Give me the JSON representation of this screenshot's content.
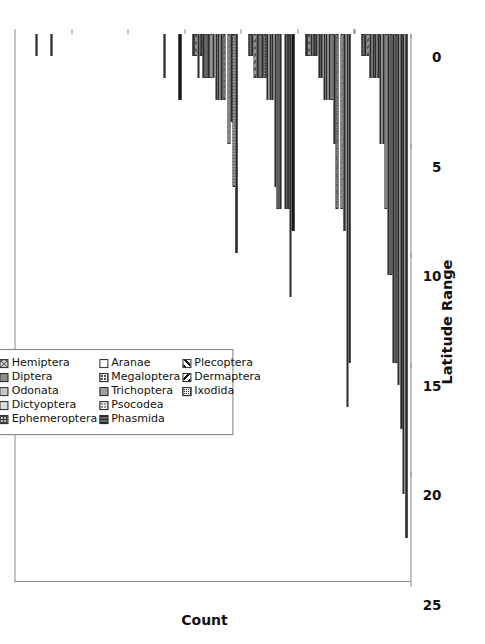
{
  "chart_data": {
    "type": "bar",
    "orientation": "horizontal-rotated",
    "title": "",
    "xlabel": "Latitude Range",
    "ylabel": "Count",
    "ylim": [
      0,
      25
    ],
    "yticks": [
      0,
      5,
      10,
      15,
      20,
      25
    ],
    "grid": false,
    "legend_position": "inside-upper-left",
    "categories": [
      "±0–9",
      "±10–19",
      "±20–29",
      "±30–39",
      "±40–49",
      "±50–59",
      "±60+"
    ],
    "series": [
      {
        "name": "Coleoptera",
        "pattern": "p-solid-black",
        "values": [
          23,
          15,
          9,
          10,
          3,
          0,
          0
        ]
      },
      {
        "name": "Ortoptera",
        "pattern": "p-vlines-light",
        "values": [
          21,
          17,
          12,
          7,
          0,
          0,
          0
        ]
      },
      {
        "name": "Hymenoptera",
        "pattern": "p-solid-dkgray",
        "values": [
          18,
          9,
          8,
          4,
          0,
          0,
          0
        ]
      },
      {
        "name": "Lepidoptera",
        "pattern": "p-diag-light",
        "values": [
          16,
          8,
          8,
          5,
          0,
          0,
          0
        ]
      },
      {
        "name": "Isoptera",
        "pattern": "p-solid-mgray",
        "values": [
          15,
          0,
          0,
          0,
          0,
          0,
          0
        ]
      },
      {
        "name": "Hemiptera",
        "pattern": "p-cross-gray",
        "values": [
          15,
          8,
          8,
          3,
          0,
          0,
          0
        ]
      },
      {
        "name": "Diptera",
        "pattern": "p-solid-gray",
        "values": [
          11,
          5,
          8,
          3,
          2,
          0,
          1
        ]
      },
      {
        "name": "Odonata",
        "pattern": "p-solid-ltgray",
        "values": [
          11,
          3,
          7,
          3,
          0,
          0,
          0
        ]
      },
      {
        "name": "Dictyoptera",
        "pattern": "p-solid-xlt",
        "values": [
          8,
          3,
          3,
          3,
          0,
          0,
          0
        ]
      },
      {
        "name": "Ephemeroptera",
        "pattern": "p-checker",
        "values": [
          5,
          3,
          3,
          2,
          0,
          0,
          0
        ]
      },
      {
        "name": "Aranae",
        "pattern": "p-white",
        "values": [
          5,
          3,
          3,
          2,
          0,
          0,
          0
        ]
      },
      {
        "name": "Megaloptera",
        "pattern": "p-dots-dark",
        "values": [
          2,
          2,
          2,
          2,
          0,
          0,
          0
        ]
      },
      {
        "name": "Trichoptera",
        "pattern": "p-solid-med",
        "values": [
          2,
          2,
          2,
          2,
          0,
          0,
          1
        ]
      },
      {
        "name": "Psocodea",
        "pattern": "p-dots-gray",
        "values": [
          2,
          1,
          2,
          2,
          0,
          0,
          0
        ]
      },
      {
        "name": "Phasmida",
        "pattern": "p-hlines-dk",
        "values": [
          2,
          1,
          2,
          1,
          0,
          0,
          0
        ]
      },
      {
        "name": "Plecoptera",
        "pattern": "p-diag-dark",
        "values": [
          1,
          1,
          2,
          2,
          0,
          0,
          0
        ]
      },
      {
        "name": "Dermaptera",
        "pattern": "p-diag-rev",
        "values": [
          1,
          1,
          1,
          1,
          0,
          0,
          0
        ]
      },
      {
        "name": "Ixodida",
        "pattern": "p-dense-check",
        "values": [
          1,
          1,
          1,
          1,
          0,
          0,
          0
        ]
      },
      {
        "name": "—",
        "pattern": "p-blank",
        "values": [
          0,
          0,
          0,
          0,
          0,
          0,
          0
        ]
      },
      {
        "name": "—",
        "pattern": "p-blank2",
        "values": [
          0,
          0,
          0,
          0,
          0,
          0,
          0
        ]
      }
    ],
    "legend_entries": [
      {
        "label": "Coleoptera",
        "pattern": "p-solid-black"
      },
      {
        "label": "Ortoptera",
        "pattern": "p-vlines-light"
      },
      {
        "label": "Hymenoptera",
        "pattern": "p-solid-dkgray"
      },
      {
        "label": "Lepidoptera",
        "pattern": "p-diag-light"
      },
      {
        "label": "Isoptera",
        "pattern": "p-solid-mgray"
      },
      {
        "label": "Hemiptera",
        "pattern": "p-cross-gray"
      },
      {
        "label": "Diptera",
        "pattern": "p-solid-gray"
      },
      {
        "label": "Odonata",
        "pattern": "p-solid-ltgray"
      },
      {
        "label": "Dictyoptera",
        "pattern": "p-solid-xlt"
      },
      {
        "label": "Ephemeroptera",
        "pattern": "p-checker"
      },
      {
        "label": "Aranae",
        "pattern": "p-white"
      },
      {
        "label": "Megaloptera",
        "pattern": "p-dots-dark"
      },
      {
        "label": "Trichoptera",
        "pattern": "p-solid-med"
      },
      {
        "label": "Psocodea",
        "pattern": "p-dots-gray"
      },
      {
        "label": "Phasmida",
        "pattern": "p-hlines-dk"
      },
      {
        "label": "Plecoptera",
        "pattern": "p-diag-dark"
      },
      {
        "label": "Dermaptera",
        "pattern": "p-diag-rev"
      },
      {
        "label": "Ixodida",
        "pattern": "p-dense-check"
      }
    ]
  },
  "colors": {
    "axis": "#8c8c8c",
    "text": "#111111",
    "background": "#ffffff",
    "legend_border": "#7d7d7d"
  }
}
